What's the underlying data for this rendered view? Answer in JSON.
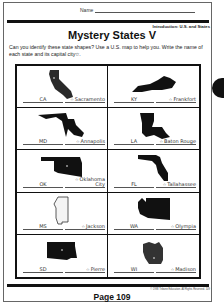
{
  "header": {
    "name_label": "Name",
    "subheading": "Introduction: U.S. and States",
    "title": "Mystery States V",
    "instructions": "Can you identify these state shapes? Use a U.S. map to help you. Write the name of each state and its capital city☆."
  },
  "states": [
    {
      "abbr": "CA",
      "capital": "Sacramento",
      "shape": "california"
    },
    {
      "abbr": "KY",
      "capital": "Frankfort",
      "shape": "kentucky"
    },
    {
      "abbr": "MD",
      "capital": "Annapolis",
      "shape": "maryland"
    },
    {
      "abbr": "LA",
      "capital": "Baton Rouge",
      "shape": "louisiana"
    },
    {
      "abbr": "OK",
      "capital": "Oklahoma City",
      "shape": "oklahoma"
    },
    {
      "abbr": "FL",
      "capital": "Tallahassee",
      "shape": "florida"
    },
    {
      "abbr": "MS",
      "capital": "Jackson",
      "shape": "mississippi"
    },
    {
      "abbr": "WA",
      "capital": "Olympia",
      "shape": "washington"
    },
    {
      "abbr": "SD",
      "capital": "Pierre",
      "shape": "south-dakota"
    },
    {
      "abbr": "WI",
      "capital": "Madison",
      "shape": "wisconsin"
    }
  ],
  "footer": {
    "copyright": "© 1998 Tribune Education. All Rights Reserved.  109",
    "page_label": "Page 109"
  },
  "icons": {
    "star": "☆"
  }
}
